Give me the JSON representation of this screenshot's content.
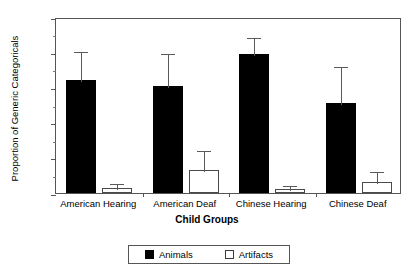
{
  "chart_data": {
    "type": "bar",
    "title": "",
    "xlabel": "Child Groups",
    "ylabel": "Proportion of Generic Categoricals",
    "ylim": [
      0.0,
      1.0
    ],
    "grid": false,
    "legend_position": "bottom-center",
    "categories": [
      "American Hearing",
      "American Deaf",
      "Chinese Hearing",
      "Chinese Deaf"
    ],
    "ytick_labels": [
      "0.0",
      ".2",
      ".4",
      ".6",
      ".8",
      "1.0"
    ],
    "ytick_values": [
      0.0,
      0.2,
      0.4,
      0.6,
      0.8,
      1.0
    ],
    "yminor_ticks": [
      0.1,
      0.3,
      0.5,
      0.7,
      0.9
    ],
    "series": [
      {
        "name": "Animals",
        "color": "#000000",
        "fill": "solid",
        "values": [
          0.64,
          0.61,
          0.79,
          0.51
        ],
        "error_upper": [
          0.81,
          0.8,
          0.89,
          0.73
        ]
      },
      {
        "name": "Artifacts",
        "color": "#ffffff",
        "fill": "open",
        "values": [
          0.03,
          0.13,
          0.02,
          0.06
        ],
        "error_upper": [
          0.06,
          0.25,
          0.05,
          0.13
        ]
      }
    ]
  },
  "legend": {
    "items": [
      {
        "label": "Animals",
        "swatch": "filled-square-icon"
      },
      {
        "label": "Artifacts",
        "swatch": "open-square-icon"
      }
    ]
  }
}
